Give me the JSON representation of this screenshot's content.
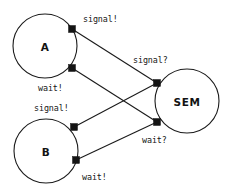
{
  "diagram": {
    "type": "node-port-connection-diagram",
    "canvas": {
      "width": 229,
      "height": 193,
      "background": "#ffffff"
    },
    "colors": {
      "stroke": "#1a1a1a",
      "port_fill": "#141414",
      "text": "#151515",
      "background": "#ffffff"
    },
    "nodes": [
      {
        "id": "A",
        "label": "A",
        "cx": 45,
        "cy": 46,
        "r": 32
      },
      {
        "id": "B",
        "label": "B",
        "cx": 46,
        "cy": 151,
        "r": 32
      },
      {
        "id": "SEM",
        "label": "SEM",
        "cx": 187,
        "cy": 101,
        "r": 32
      }
    ],
    "ports": [
      {
        "id": "a-signal",
        "node": "A",
        "label": "signal!",
        "x": 72,
        "y": 29,
        "label_x": 83,
        "label_y": 19
      },
      {
        "id": "a-wait",
        "node": "A",
        "label": "wait!",
        "x": 72,
        "y": 68,
        "label_x": 38,
        "label_y": 88
      },
      {
        "id": "b-signal",
        "node": "B",
        "label": "signal!",
        "x": 74,
        "y": 127,
        "label_x": 34,
        "label_y": 108
      },
      {
        "id": "b-wait",
        "node": "B",
        "label": "wait!",
        "x": 76,
        "y": 160,
        "label_x": 82,
        "label_y": 177
      },
      {
        "id": "sem-signal",
        "node": "SEM",
        "label": "signal?",
        "x": 157,
        "y": 83,
        "label_x": 133,
        "label_y": 60
      },
      {
        "id": "sem-wait",
        "node": "SEM",
        "label": "wait?",
        "x": 157,
        "y": 122,
        "label_x": 142,
        "label_y": 140
      }
    ],
    "connections": [
      {
        "id": "link-a-signal-sem-signal",
        "from": "a-signal",
        "to": "sem-signal",
        "x1": 72,
        "y1": 29,
        "x2": 157,
        "y2": 83
      },
      {
        "id": "link-a-wait-sem-wait",
        "from": "a-wait",
        "to": "sem-wait",
        "x1": 72,
        "y1": 68,
        "x2": 157,
        "y2": 122
      },
      {
        "id": "link-b-signal-sem-signal",
        "from": "b-signal",
        "to": "sem-signal",
        "x1": 74,
        "y1": 127,
        "x2": 157,
        "y2": 83
      },
      {
        "id": "link-b-wait-sem-wait",
        "from": "b-wait",
        "to": "sem-wait",
        "x1": 76,
        "y1": 160,
        "x2": 157,
        "y2": 122
      }
    ],
    "port_size": 7
  }
}
